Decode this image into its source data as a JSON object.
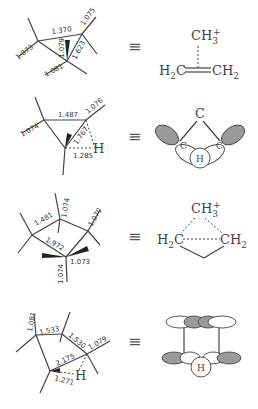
{
  "equivalence_symbol": "≡",
  "structures": [
    {
      "id": "propene-ch3-complex",
      "bond_lengths": [
        "1.073",
        "1.370",
        "1.075",
        "1.079",
        "1.623",
        "1.081"
      ],
      "right": {
        "top": "CH",
        "top_sub": "3",
        "top_sup": "+",
        "left": "H",
        "left_sub": "2",
        "left_tail": "C",
        "right": "CH",
        "right_sub": "2"
      }
    },
    {
      "id": "h-bridged",
      "bond_lengths": [
        "1.074",
        "1.487",
        "1.076",
        "1.767",
        "1.285"
      ],
      "atom_h": "H",
      "right": {
        "top": "C",
        "left": "C",
        "right": "C",
        "center": "H"
      }
    },
    {
      "id": "corner-methyl",
      "bond_lengths": [
        "1.481",
        "1.074",
        "1.070",
        "1.972",
        "1.073",
        "1.074"
      ],
      "right": {
        "top": "CH",
        "top_sub": "3",
        "top_sup": "+",
        "left": "H",
        "left_sub": "2",
        "left_tail": "C",
        "right": "CH",
        "right_sub": "2"
      }
    },
    {
      "id": "four-center",
      "bond_lengths": [
        "1.081",
        "1.533",
        "1.530",
        "1.079",
        "2.175",
        "1.271"
      ],
      "atom_h": "H",
      "right": {
        "center": "H"
      }
    }
  ]
}
